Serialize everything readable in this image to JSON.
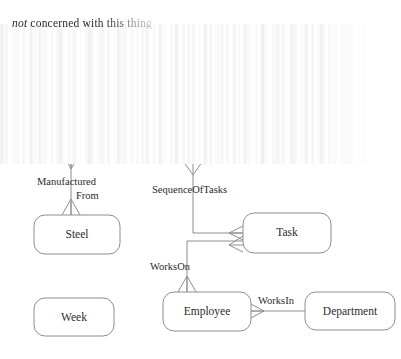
{
  "caption": {
    "prefix_italic": "not",
    "text": " concerned with this thing",
    "full": "not concerned with this thing"
  },
  "diagram": {
    "type": "entity-relationship-diagram",
    "entities": [
      {
        "id": "steel",
        "label": "Steel",
        "x": 34,
        "y": 215,
        "w": 86,
        "h": 39
      },
      {
        "id": "task",
        "label": "Task",
        "x": 243,
        "y": 213,
        "w": 88,
        "h": 40
      },
      {
        "id": "employee",
        "label": "Employee",
        "x": 163,
        "y": 292,
        "w": 88,
        "h": 39
      },
      {
        "id": "department",
        "label": "Department",
        "x": 305,
        "y": 292,
        "w": 90,
        "h": 38
      },
      {
        "id": "week",
        "label": "Week",
        "x": 34,
        "y": 298,
        "w": 80,
        "h": 38
      }
    ],
    "relationships": [
      {
        "id": "manufactured-from",
        "label": "ManufacturedFrom",
        "label_line1": "Manufactured",
        "label_line2": "From",
        "from": "offscreen-top",
        "to": "steel"
      },
      {
        "id": "sequence-of-tasks",
        "label": "SequenceOfTasks",
        "from": "offscreen-top",
        "to": "task"
      },
      {
        "id": "works-on",
        "label": "WorksOn",
        "from": "task",
        "to": "employee"
      },
      {
        "id": "works-in",
        "label": "WorksIn",
        "from": "employee",
        "to": "department"
      }
    ]
  },
  "artifact": {
    "name": "vertical-streak-smear",
    "description": "Vertical white streak rendering artifact obscuring the upper portion of the diagram"
  },
  "colors": {
    "stroke": "#8e8e8e",
    "ghost_stroke": "#c9c9c9",
    "text": "#2b2b2b",
    "background": "#ffffff"
  }
}
